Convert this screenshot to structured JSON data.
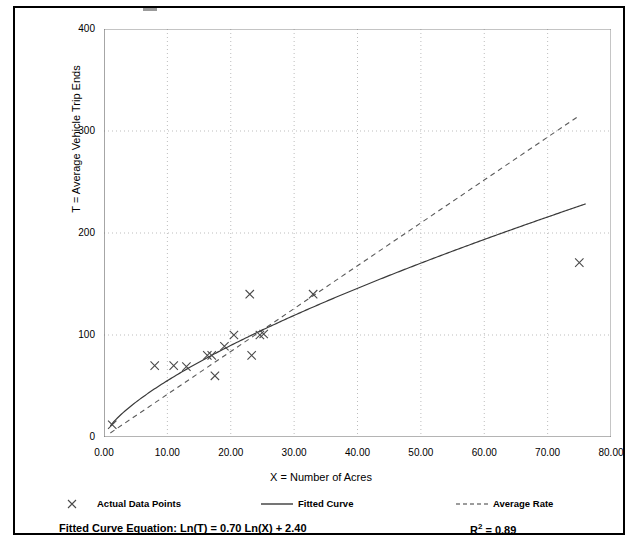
{
  "chart_data": {
    "type": "scatter",
    "title": "",
    "xlabel": "X = Number of Acres",
    "ylabel": "T = Average Vehicle Trip Ends",
    "xlim": [
      0,
      80
    ],
    "ylim": [
      0,
      400
    ],
    "xticks": [
      "0.00",
      "10.00",
      "20.00",
      "30.00",
      "40.00",
      "50.00",
      "60.00",
      "70.00",
      "80.00"
    ],
    "xtick_values": [
      0,
      10,
      20,
      30,
      40,
      50,
      60,
      70,
      80
    ],
    "yticks": [
      "0",
      "100",
      "200",
      "300",
      "400"
    ],
    "ytick_values": [
      0,
      100,
      200,
      300,
      400
    ],
    "y_minor_ticks": [
      50,
      150,
      250,
      350
    ],
    "grid": true,
    "grid_style": "dotted",
    "grid_color": "#bdbdbd",
    "legend_position": "below-plot",
    "points": [
      {
        "x": 1.3,
        "y": 12
      },
      {
        "x": 8.0,
        "y": 70
      },
      {
        "x": 11.0,
        "y": 70
      },
      {
        "x": 13.0,
        "y": 69
      },
      {
        "x": 16.3,
        "y": 80
      },
      {
        "x": 17.0,
        "y": 80
      },
      {
        "x": 17.5,
        "y": 60
      },
      {
        "x": 19.0,
        "y": 89
      },
      {
        "x": 20.5,
        "y": 100
      },
      {
        "x": 23.0,
        "y": 140
      },
      {
        "x": 23.3,
        "y": 80
      },
      {
        "x": 24.6,
        "y": 100
      },
      {
        "x": 25.2,
        "y": 101
      },
      {
        "x": 33.0,
        "y": 140
      },
      {
        "x": 75.0,
        "y": 171
      }
    ],
    "series": [
      {
        "name": "Fitted Curve",
        "type": "line",
        "style": "solid",
        "color": "#3a3a3a",
        "equation": "Ln(T) = 0.70 Ln(X) + 2.40",
        "slope": 0.7,
        "intercept": 2.4,
        "x_start": 1.0,
        "x_end": 76.0
      },
      {
        "name": "Average Rate",
        "type": "line",
        "style": "dashed",
        "color": "#5a5a5a",
        "x_start": 1.0,
        "x_end": 75.0,
        "y_start": 4,
        "y_end": 315
      }
    ],
    "annotations": {
      "equation_label": "Fitted Curve Equation:",
      "equation_value": "Ln(T) = 0.70 Ln(X) + 2.40",
      "r_squared_label": "R",
      "r_squared_sup": "2",
      "r_squared_value": "= 0.89"
    }
  },
  "legend": {
    "items": [
      {
        "label": "Actual Data Points",
        "marker": "x-marker-icon"
      },
      {
        "label": "Fitted Curve",
        "marker": "solid-line-icon"
      },
      {
        "label": "Average Rate",
        "marker": "dashed-line-icon"
      }
    ]
  }
}
